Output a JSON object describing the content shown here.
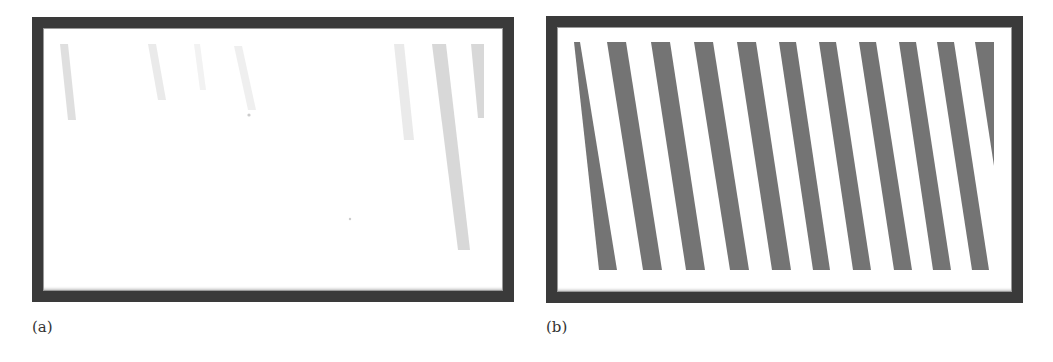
{
  "figure": {
    "panels": [
      {
        "id": "a",
        "caption": "(a)",
        "frame": {
          "x": 32,
          "y": 17,
          "w": 482,
          "h": 285,
          "border": 11
        },
        "stripe_color": "#b8b8b8",
        "stripes": [
          {
            "x1": 60,
            "x2": 68,
            "x3": 76,
            "x4": 68,
            "y1": 44,
            "y2": 120,
            "opacity": 0.45
          },
          {
            "x1": 148,
            "x2": 156,
            "x3": 166,
            "x4": 158,
            "y1": 44,
            "y2": 100,
            "opacity": 0.3
          },
          {
            "x1": 194,
            "x2": 200,
            "x3": 206,
            "x4": 200,
            "y1": 44,
            "y2": 90,
            "opacity": 0.18
          },
          {
            "x1": 234,
            "x2": 242,
            "x3": 256,
            "x4": 248,
            "y1": 46,
            "y2": 110,
            "opacity": 0.22
          },
          {
            "x1": 394,
            "x2": 404,
            "x3": 414,
            "x4": 404,
            "y1": 44,
            "y2": 140,
            "opacity": 0.3
          },
          {
            "x1": 432,
            "x2": 446,
            "x3": 470,
            "x4": 458,
            "y1": 44,
            "y2": 250,
            "opacity": 0.55
          },
          {
            "x1": 471,
            "x2": 484,
            "x3": 484,
            "x4": 478,
            "y1": 44,
            "y2": 118,
            "opacity": 0.55
          }
        ],
        "specks": [
          {
            "x": 249,
            "y": 115,
            "r": 1.6
          },
          {
            "x": 350,
            "y": 219,
            "r": 1.2
          }
        ]
      },
      {
        "id": "b",
        "caption": "(b)",
        "frame": {
          "x": 546,
          "y": 16,
          "w": 477,
          "h": 287,
          "border": 11
        },
        "stripe_color": "#747474",
        "stripes": [
          {
            "x1": 574,
            "x2": 580,
            "x3": 617,
            "x4": 599,
            "y1": 42,
            "y2": 270
          },
          {
            "x1": 607,
            "x2": 626,
            "x3": 662,
            "x4": 643,
            "y1": 42,
            "y2": 270
          },
          {
            "x1": 651,
            "x2": 670,
            "x3": 705,
            "x4": 686,
            "y1": 42,
            "y2": 270
          },
          {
            "x1": 694,
            "x2": 713,
            "x3": 749,
            "x4": 730,
            "y1": 42,
            "y2": 270
          },
          {
            "x1": 737,
            "x2": 756,
            "x3": 791,
            "x4": 772,
            "y1": 42,
            "y2": 270
          },
          {
            "x1": 779,
            "x2": 796,
            "x3": 830,
            "x4": 813,
            "y1": 42,
            "y2": 270
          },
          {
            "x1": 819,
            "x2": 836,
            "x3": 871,
            "x4": 853,
            "y1": 42,
            "y2": 270
          },
          {
            "x1": 859,
            "x2": 876,
            "x3": 912,
            "x4": 894,
            "y1": 42,
            "y2": 270
          },
          {
            "x1": 899,
            "x2": 916,
            "x3": 951,
            "x4": 933,
            "y1": 42,
            "y2": 270
          },
          {
            "x1": 937,
            "x2": 954,
            "x3": 989,
            "x4": 972,
            "y1": 42,
            "y2": 270
          }
        ],
        "wedge": {
          "points": "975,42 994,42 994,166"
        }
      }
    ]
  }
}
